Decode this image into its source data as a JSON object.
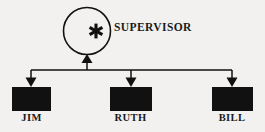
{
  "diagram": {
    "type": "organizational-chart",
    "background_color": "#f2f1ef",
    "ink_color": "#111111",
    "supervisor": {
      "label": "SUPERVISOR",
      "shape": "circle",
      "inner_symbol": "*",
      "inner_symbol_name": "asterisk-icon",
      "fill": "none",
      "stroke": "#111111"
    },
    "subordinates": [
      {
        "label": "JIM",
        "shape": "rectangle",
        "fill": "#111111"
      },
      {
        "label": "RUTH",
        "shape": "rectangle",
        "fill": "#111111"
      },
      {
        "label": "BILL",
        "shape": "rectangle",
        "fill": "#111111"
      }
    ],
    "connectors": {
      "style": "bus",
      "arrow_up_count": 1,
      "arrow_down_count": 3
    }
  }
}
